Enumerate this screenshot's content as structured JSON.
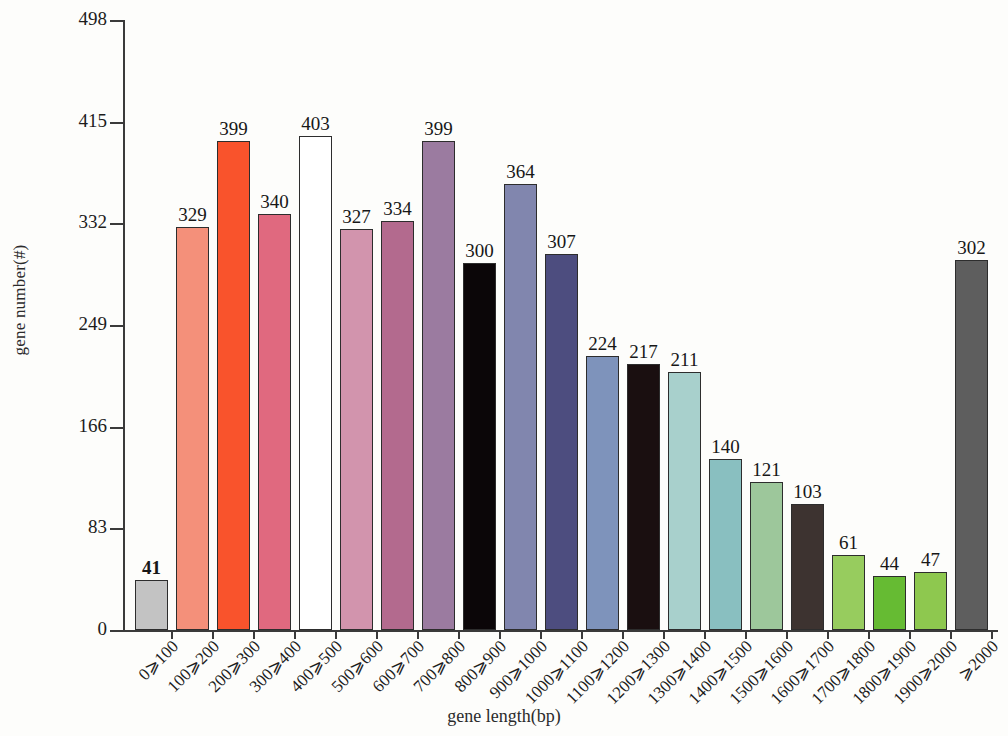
{
  "chart_data": {
    "type": "bar",
    "title": "",
    "xlabel": "gene length(bp)",
    "ylabel": "gene number(#)",
    "ylim": [
      0,
      498
    ],
    "yticks": [
      0,
      83,
      166,
      249,
      332,
      415,
      498
    ],
    "grid": false,
    "legend": "none",
    "categories": [
      "0⩾100",
      "100⩾200",
      "200⩾300",
      "300⩾400",
      "400⩾500",
      "500⩾600",
      "600⩾700",
      "700⩾800",
      "800⩾900",
      "900⩾1000",
      "1000⩾1100",
      "1100⩾1200",
      "1200⩾1300",
      "1300⩾1400",
      "1400⩾1500",
      "1500⩾1600",
      "1600⩾1700",
      "1700⩾1800",
      "1800⩾1900",
      "1900⩾2000",
      "⩾2000"
    ],
    "values": [
      41,
      329,
      399,
      340,
      403,
      327,
      334,
      399,
      300,
      364,
      307,
      224,
      217,
      211,
      140,
      121,
      103,
      61,
      44,
      47,
      302
    ],
    "bar_colors": [
      "#c3c3c3",
      "#f4907a",
      "#f9532c",
      "#e0697f",
      "#ffffff",
      "#d294ad",
      "#b36a8e",
      "#9b7ba0",
      "#0b0608",
      "#8186ae",
      "#4d4d7f",
      "#7e93bb",
      "#1a0f10",
      "#a8d0cc",
      "#89bfc0",
      "#9dc79b",
      "#3d3330",
      "#97cc5e",
      "#66bb33",
      "#8ec84f",
      "#5e5e5e"
    ],
    "bar_edge_color": "#2d2d2d",
    "value_label_bold_index": 0
  },
  "axis": {
    "y_title": "gene number(#)",
    "x_title": "gene length(bp)"
  }
}
